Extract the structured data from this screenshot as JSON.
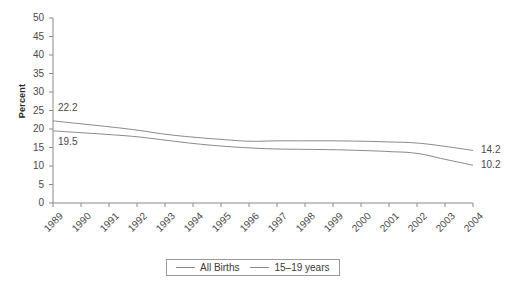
{
  "ghost": {
    "line1": "",
    "line2": ""
  },
  "chart_data": {
    "type": "line",
    "title": "",
    "xlabel": "",
    "ylabel": "Percent",
    "ylim": [
      0,
      50
    ],
    "yticks": [
      0,
      5,
      10,
      15,
      20,
      25,
      30,
      35,
      40,
      45,
      50
    ],
    "ytick_labels": [
      "0",
      "5",
      "10",
      "15",
      "20",
      "25",
      "30",
      "35",
      "40",
      "45",
      "50"
    ],
    "grid": false,
    "legend_position": "bottom",
    "categories": [
      "1989",
      "1990",
      "1991",
      "1992",
      "1993",
      "1994",
      "1995",
      "1996",
      "1997",
      "1998",
      "1999",
      "2000",
      "2001",
      "2002",
      "2003",
      "2004"
    ],
    "x": [
      1989,
      1990,
      1991,
      1992,
      1993,
      1994,
      1995,
      1996,
      1997,
      1998,
      1999,
      2000,
      2001,
      2002,
      2003,
      2004
    ],
    "series": [
      {
        "name": "All Births",
        "color": "#8a8a8a",
        "values": [
          22.2,
          21.4,
          20.6,
          19.7,
          18.6,
          17.8,
          17.2,
          16.7,
          16.8,
          16.8,
          16.8,
          16.7,
          16.5,
          16.2,
          15.3,
          14.2
        ]
      },
      {
        "name": "15–19 years",
        "color": "#8a8a8a",
        "values": [
          19.5,
          19.0,
          18.5,
          17.9,
          17.0,
          16.1,
          15.4,
          14.9,
          14.6,
          14.5,
          14.4,
          14.2,
          13.9,
          13.4,
          11.8,
          10.2
        ]
      }
    ],
    "annotations": [
      {
        "text": "22.2",
        "series": "All Births",
        "at": "1989",
        "position": "above-left"
      },
      {
        "text": "19.5",
        "series": "15–19 years",
        "at": "1989",
        "position": "below-left"
      },
      {
        "text": "14.2",
        "series": "All Births",
        "at": "2004",
        "position": "right"
      },
      {
        "text": "10.2",
        "series": "15–19 years",
        "at": "2004",
        "position": "right"
      }
    ]
  },
  "legend": {
    "entries": [
      {
        "label": "All Births"
      },
      {
        "label": "15–19 years"
      }
    ]
  }
}
